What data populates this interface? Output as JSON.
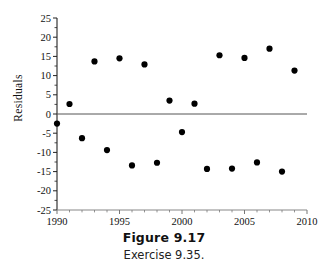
{
  "figure": {
    "caption_title": "Figure 9.17",
    "caption_subtitle": "Exercise 9.35."
  },
  "chart_data": {
    "type": "scatter",
    "title": "",
    "xlabel": "",
    "ylabel": "Residuals",
    "xlim": [
      1990,
      2010
    ],
    "ylim": [
      -25,
      25
    ],
    "xticks": [
      1990,
      1995,
      2000,
      2005,
      2010
    ],
    "yticks": [
      25,
      20,
      15,
      10,
      5,
      0,
      -5,
      -10,
      -15,
      -20,
      -25
    ],
    "xtick_labels": [
      "1990",
      "1995",
      "2000",
      "2005",
      "2010"
    ],
    "ytick_labels": [
      "25",
      "20",
      "15",
      "10",
      "5",
      "0",
      "-5",
      "-10",
      "-15",
      "-20",
      "-25"
    ],
    "minor_xtick_interval": 1,
    "minor_ytick_interval": 5,
    "grid": false,
    "legend": false,
    "reference_line": {
      "y": 0,
      "color": "#555555",
      "width": 1
    },
    "marker": {
      "shape": "circle",
      "color": "#000000",
      "size": 3.1
    },
    "x": [
      1990,
      1990,
      1991,
      1992,
      1993,
      1994,
      1995,
      1996,
      1997,
      1998,
      1999,
      2000,
      2001,
      2002,
      2003,
      2004,
      2005,
      2006,
      2007,
      2008,
      2009
    ],
    "y": [
      -2.5,
      2.6,
      2.6,
      -6.3,
      13.7,
      -9.4,
      14.5,
      -13.4,
      12.9,
      -12.7,
      3.5,
      -4.7,
      2.7,
      -14.3,
      15.3,
      -14.2,
      14.6,
      -12.6,
      17.0,
      -15.0,
      11.3
    ],
    "points": [
      {
        "x": 1990,
        "y": -2.5
      },
      {
        "x": 1991,
        "y": 2.6
      },
      {
        "x": 1992,
        "y": -6.3
      },
      {
        "x": 1993,
        "y": 13.7
      },
      {
        "x": 1994,
        "y": -9.4
      },
      {
        "x": 1995,
        "y": 14.5
      },
      {
        "x": 1996,
        "y": -13.4
      },
      {
        "x": 1997,
        "y": 12.9
      },
      {
        "x": 1998,
        "y": -12.7
      },
      {
        "x": 1999,
        "y": 3.5
      },
      {
        "x": 2000,
        "y": -4.7
      },
      {
        "x": 2001,
        "y": 2.7
      },
      {
        "x": 2002,
        "y": -14.3
      },
      {
        "x": 2003,
        "y": 15.3
      },
      {
        "x": 2004,
        "y": -14.2
      },
      {
        "x": 2005,
        "y": 14.6
      },
      {
        "x": 2006,
        "y": -12.6
      },
      {
        "x": 2007,
        "y": 17.0
      },
      {
        "x": 2008,
        "y": -15.0
      },
      {
        "x": 2009,
        "y": 11.3
      }
    ],
    "colors": {
      "marker": "#000000",
      "axis": "#222222",
      "reference_line": "#555555",
      "background": "#ffffff"
    }
  }
}
